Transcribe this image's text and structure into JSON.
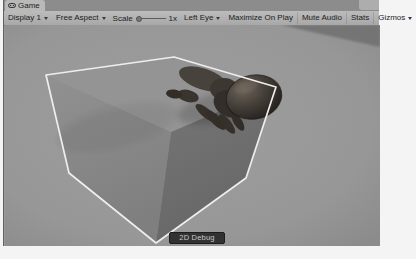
{
  "window": {
    "tab_label": "Game"
  },
  "toolbar": {
    "display_label": "Display 1",
    "aspect_label": "Free Aspect",
    "scale_label": "Scale",
    "scale_value": "1x",
    "left_eye_label": "Left Eye",
    "maximize_label": "Maximize On Play",
    "mute_label": "Mute Audio",
    "stats_label": "Stats",
    "gizmos_label": "Gizmos"
  },
  "scene": {
    "debug_button_label": "2D Debug"
  },
  "icons": {
    "tab_icon": "game-view-icon",
    "dropdown_icon": "chevron-down-icon"
  },
  "colors": {
    "tabbar_bg": "#8c8c8c",
    "tab_active_bg": "#b9b9b9",
    "toolbar_bg": "#b0b0b0",
    "scene_bg": "#9a9a9a",
    "cube_top": "#949494",
    "cube_left": "#8c8c8c",
    "cube_right": "#6f6f6f",
    "wireframe": "#eeeeee",
    "corner_wedge": "#6f6f6f",
    "debug_button_bg": "#2a2a2a",
    "debug_button_text": "#c9c9c9"
  }
}
